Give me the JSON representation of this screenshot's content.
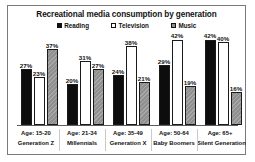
{
  "chart_data": {
    "type": "bar",
    "title": "Recreational media consumption by generation",
    "xlabel": "",
    "ylabel": "",
    "ylim": [
      0,
      45
    ],
    "grid": false,
    "legend_position": "top-center",
    "categories": [
      "Age: 15-20\nGeneration Z",
      "Age: 21-34\nMillennials",
      "Age: 35-49\nGeneration X",
      "Age: 50-64\nBaby Boomers",
      "Age: 65+\nSilent Generation"
    ],
    "category_lines": [
      {
        "age": "Age: 15-20",
        "name": "Generation Z"
      },
      {
        "age": "Age: 21-34",
        "name": "Millennials"
      },
      {
        "age": "Age: 35-49",
        "name": "Generation X"
      },
      {
        "age": "Age: 50-64",
        "name": "Baby Boomers"
      },
      {
        "age": "Age: 65+",
        "name": "Silent Generation"
      }
    ],
    "series": [
      {
        "name": "Reading",
        "color": "#0d0d0d",
        "values": [
          27,
          20,
          24,
          29,
          42
        ],
        "labels": [
          "27%",
          "20%",
          "24%",
          "29%",
          "42%"
        ]
      },
      {
        "name": "Television",
        "color": "#ffffff",
        "values": [
          23,
          31,
          38,
          42,
          40
        ],
        "labels": [
          "23%",
          "31%",
          "38%",
          "42%",
          "40%"
        ]
      },
      {
        "name": "Music",
        "color": "#909090",
        "values": [
          37,
          27,
          21,
          19,
          16
        ],
        "labels": [
          "37%",
          "27%",
          "21%",
          "19%",
          "16%"
        ]
      }
    ]
  },
  "legend": {
    "items": [
      {
        "label": "Reading"
      },
      {
        "label": "Television"
      },
      {
        "label": "Music"
      }
    ]
  }
}
